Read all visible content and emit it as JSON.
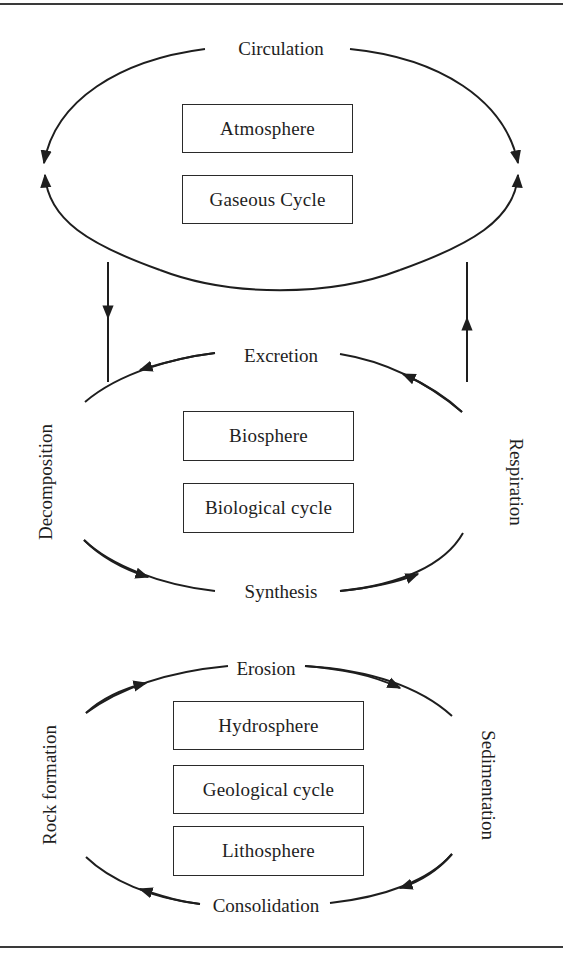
{
  "diagram": {
    "atmosphere_cycle": {
      "flow_top": "Circulation",
      "boxes": [
        "Atmosphere",
        "Gaseous Cycle"
      ]
    },
    "links": {
      "down_arrow": "atmosphere-to-biosphere",
      "up_arrow": "biosphere-to-atmosphere"
    },
    "biological_cycle": {
      "flow_top": "Excretion",
      "flow_left": "Decomposition",
      "flow_right": "Respiration",
      "flow_bottom": "Synthesis",
      "boxes": [
        "Biosphere",
        "Biological cycle"
      ]
    },
    "geological_cycle": {
      "flow_top": "Erosion",
      "flow_left": "Rock formation",
      "flow_right": "Sedimentation",
      "flow_bottom": "Consolidation",
      "boxes": [
        "Hydrosphere",
        "Geological cycle",
        "Lithosphere"
      ]
    },
    "colors": {
      "line": "#1e1e1e",
      "background": "#ffffff"
    }
  }
}
